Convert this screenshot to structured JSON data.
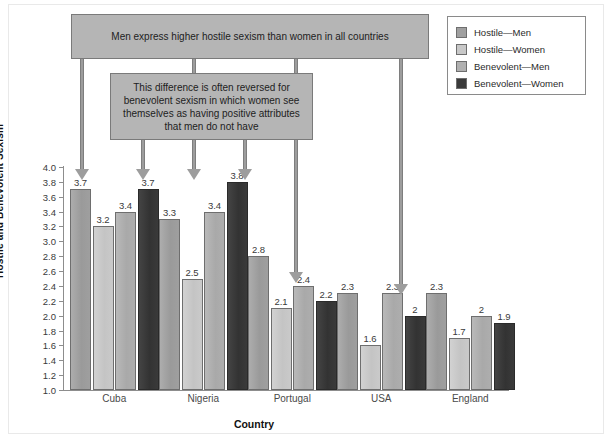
{
  "chart_data": {
    "type": "bar",
    "title": "",
    "xlabel": "Country",
    "ylabel": "Hostile and Benevolent Sexism",
    "ylim": [
      1.0,
      4.0
    ],
    "ytick_step": 0.2,
    "grid": false,
    "legend_position": "top-right",
    "categories": [
      "Cuba",
      "Nigeria",
      "Portugal",
      "USA",
      "England"
    ],
    "series": [
      {
        "name": "Hostile—Men",
        "color": "#a0a0a0",
        "values": [
          3.7,
          3.3,
          2.8,
          2.3,
          2.3
        ],
        "labels": [
          "3.7",
          "3.3",
          "2.8",
          "2.3",
          "2.3"
        ]
      },
      {
        "name": "Hostile—Women",
        "color": "#c8c8c8",
        "values": [
          3.2,
          2.5,
          2.1,
          1.6,
          1.7
        ],
        "labels": [
          "3.2",
          "2.5",
          "2.1",
          "1.6",
          "1.7"
        ]
      },
      {
        "name": "Benevolent—Men",
        "color": "#b0b0b0",
        "values": [
          3.4,
          3.4,
          2.4,
          2.3,
          2.0
        ],
        "labels": [
          "3.4",
          "3.4",
          "2.4",
          "2.3",
          "2"
        ]
      },
      {
        "name": "Benevolent—Women",
        "color": "#3a3a3a",
        "values": [
          3.7,
          3.8,
          2.2,
          2.0,
          1.9
        ],
        "labels": [
          "3.7",
          "3.8",
          "2.2",
          "2",
          "1.9"
        ]
      }
    ],
    "ytick_labels": [
      "4.0",
      "3.8",
      "3.6",
      "3.4",
      "3.2",
      "3.0",
      "2.8",
      "2.6",
      "2.4",
      "2.2",
      "2.0",
      "1.8",
      "1.6",
      "1.4",
      "1.2",
      "1.0"
    ],
    "annotations": [
      {
        "id": "callout-1",
        "text": "Men express higher hostile sexism than women in all countries",
        "points_to": [
          "Cuba Hostile—Men",
          "Nigeria Hostile—Men",
          "Portugal Hostile—Men",
          "USA Hostile—Men"
        ]
      },
      {
        "id": "callout-2",
        "text": "This difference is often reversed for benevolent sexism in which women see themselves as having positive attributes that men do not have",
        "points_to": [
          "Cuba Benevolent—Women",
          "Nigeria Benevolent—Women"
        ]
      }
    ]
  },
  "legend": {
    "items": [
      {
        "label": "Hostile—Men",
        "color": "#a0a0a0"
      },
      {
        "label": "Hostile—Women",
        "color": "#c8c8c8"
      },
      {
        "label": "Benevolent—Men",
        "color": "#b0b0b0"
      },
      {
        "label": "Benevolent—Women",
        "color": "#3a3a3a"
      }
    ]
  }
}
